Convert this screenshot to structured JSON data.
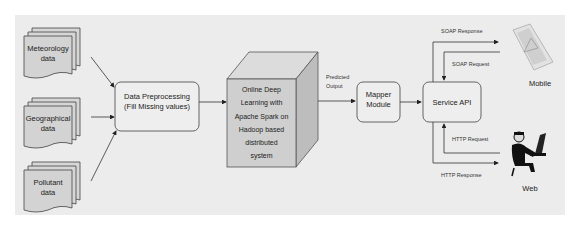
{
  "diagram": {
    "sources": [
      {
        "line1": "Meteorology",
        "line2": "data"
      },
      {
        "line1": "Geographical",
        "line2": "data"
      },
      {
        "line1": "Pollutant",
        "line2": "data"
      }
    ],
    "preprocessing": {
      "line1": "Data Preprocessing",
      "line2": "(Fill Missing values)"
    },
    "learning": {
      "lines": [
        "Online Deep",
        "Learning with",
        "Apache Spark on",
        "Hadoop based",
        "distributed",
        "system"
      ]
    },
    "predicted_output": {
      "line1": "Predicted",
      "line2": "Output"
    },
    "mapper": {
      "line1": "Mapper",
      "line2": "Module"
    },
    "service_api": {
      "label": "Service API"
    },
    "edges": {
      "soap_response": "SOAP Response",
      "soap_request": "SOAP Request",
      "http_request": "HTTP Request",
      "http_response": "HTTP Response"
    },
    "clients": {
      "mobile": {
        "label": "Mobile",
        "icon": "smartphone-warning-icon"
      },
      "web": {
        "label": "Web",
        "icon": "person-at-computer-icon"
      }
    }
  }
}
